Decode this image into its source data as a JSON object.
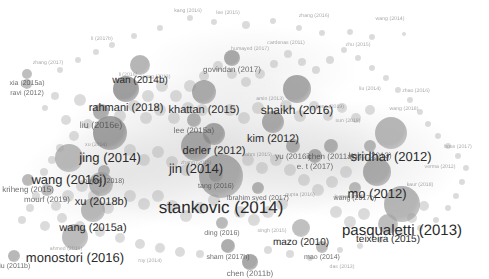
{
  "figure": {
    "kind": "bibliometric-co-citation-network",
    "tool_style": "VOSviewer density/network map",
    "background_color": "#ffffff",
    "node_color": "#8a8a8a",
    "node_color_dark": "#4d4d4d",
    "label_color": "#2b2b2b",
    "width": 489,
    "height": 279
  },
  "chart_data": {
    "type": "scatter",
    "title": "",
    "xlabel": "",
    "ylabel": "",
    "grid": false,
    "legend": "none",
    "xlim": [
      0,
      489
    ],
    "ylim": [
      0,
      279
    ],
    "note": "Node size encodes citation weight; position encodes co-citation similarity. Greyscale rendering.",
    "nodes": [
      {
        "label": "stankovic (2014)",
        "x": 221,
        "y": 176,
        "r": 22,
        "font": 17,
        "tier": "major",
        "shade": "#8f8f8f"
      },
      {
        "label": "pasqualetti (2013)",
        "x": 402,
        "y": 204,
        "r": 18,
        "font": 15,
        "tier": "major",
        "shade": "#9a9a9a"
      },
      {
        "label": "wang (2016j)",
        "x": 69,
        "y": 158,
        "r": 14,
        "font": 13,
        "tier": "major",
        "shade": "#a0a0a0"
      },
      {
        "label": "jin (2014)",
        "x": 196,
        "y": 146,
        "r": 15,
        "font": 13,
        "tier": "major",
        "shade": "#8b8b8b"
      },
      {
        "label": "monostori (2016)",
        "x": 75,
        "y": 237,
        "r": 13,
        "font": 13,
        "tier": "major",
        "shade": "#a3a3a3"
      },
      {
        "label": "sridhar (2012)",
        "x": 391,
        "y": 133,
        "r": 16,
        "font": 13,
        "tier": "major",
        "shade": "#9d9d9d"
      },
      {
        "label": "mo (2012)",
        "x": 377,
        "y": 172,
        "r": 14,
        "font": 13,
        "tier": "major",
        "shade": "#8d8d8d"
      },
      {
        "label": "jing (2014)",
        "x": 110,
        "y": 133,
        "r": 17,
        "font": 13,
        "tier": "major",
        "shade": "#7e7e7e"
      },
      {
        "label": "shaikh (2016)",
        "x": 297,
        "y": 89,
        "r": 14,
        "font": 12,
        "tier": "major",
        "shade": "#888888"
      },
      {
        "label": "wang (2015a)",
        "x": 93,
        "y": 210,
        "r": 12,
        "font": 11,
        "tier": "mid",
        "shade": "#9f9f9f"
      },
      {
        "label": "xu (2018b)",
        "x": 101,
        "y": 184,
        "r": 12,
        "font": 11,
        "tier": "mid",
        "shade": "#979797"
      },
      {
        "label": "rahmani (2018)",
        "x": 126,
        "y": 89,
        "r": 13,
        "font": 11,
        "tier": "mid",
        "shade": "#7a7a7a"
      },
      {
        "label": "khattan (2015)",
        "x": 204,
        "y": 92,
        "r": 12,
        "font": 11,
        "tier": "mid",
        "shade": "#8e8e8e"
      },
      {
        "label": "derler (2012)",
        "x": 214,
        "y": 134,
        "r": 11,
        "font": 11,
        "tier": "mid",
        "shade": "#858585"
      },
      {
        "label": "kim (2012)",
        "x": 273,
        "y": 122,
        "r": 11,
        "font": 11,
        "tier": "mid",
        "shade": "#8c8c8c"
      },
      {
        "label": "wan (2014b)",
        "x": 140,
        "y": 65,
        "r": 10,
        "font": 10,
        "tier": "mid",
        "shade": "#9a9a9a"
      },
      {
        "label": "teixeira (2015)",
        "x": 388,
        "y": 224,
        "r": 10,
        "font": 10,
        "tier": "mid",
        "shade": "#a5a5a5"
      },
      {
        "label": "mazo (2010)",
        "x": 301,
        "y": 228,
        "r": 9,
        "font": 10,
        "tier": "mid",
        "shade": "#a8a8a8"
      },
      {
        "label": "liu (2016e)",
        "x": 101,
        "y": 112,
        "r": 8,
        "font": 9,
        "tier": "small",
        "shade": "#909090"
      },
      {
        "label": "govindan (2017)",
        "x": 232,
        "y": 58,
        "r": 8,
        "font": 8,
        "tier": "small",
        "shade": "#8a8a8a"
      },
      {
        "label": "yu (2016i)",
        "x": 293,
        "y": 146,
        "r": 7,
        "font": 8,
        "tier": "small",
        "shade": "#909090"
      },
      {
        "label": "chen (2011a)",
        "x": 331,
        "y": 146,
        "r": 7,
        "font": 8,
        "tier": "small",
        "shade": "#949494"
      },
      {
        "label": "hahn (2013)",
        "x": 370,
        "y": 146,
        "r": 6,
        "font": 8,
        "tier": "small",
        "shade": "#9c9c9c"
      },
      {
        "label": "e. t (2017)",
        "x": 315,
        "y": 156,
        "r": 7,
        "font": 8,
        "tier": "small",
        "shade": "#8d8d8d"
      },
      {
        "label": "lee (2015a)",
        "x": 194,
        "y": 120,
        "r": 7,
        "font": 8,
        "tier": "small",
        "shade": "#969696"
      },
      {
        "label": "kriheng (2015)",
        "x": 28,
        "y": 180,
        "r": 6,
        "font": 8,
        "tier": "small",
        "shade": "#a0a0a0"
      },
      {
        "label": "mourf (2019)",
        "x": 47,
        "y": 190,
        "r": 6,
        "font": 8,
        "tier": "small",
        "shade": "#a2a2a2"
      },
      {
        "label": "boyes (2018)",
        "x": 104,
        "y": 171,
        "r": 6,
        "font": 7,
        "tier": "small",
        "shade": "#9a9a9a"
      },
      {
        "label": "xia (2015a)",
        "x": 27,
        "y": 74,
        "r": 5,
        "font": 7,
        "tier": "small",
        "shade": "#a6a6a6"
      },
      {
        "label": "ravi (2012)",
        "x": 27,
        "y": 84,
        "r": 5,
        "font": 7,
        "tier": "small",
        "shade": "#a6a6a6"
      },
      {
        "label": "ibrahim syed (2017)",
        "x": 258,
        "y": 188,
        "r": 6,
        "font": 7,
        "tier": "small",
        "shade": "#969696"
      },
      {
        "label": "sham (2017h)",
        "x": 228,
        "y": 246,
        "r": 7,
        "font": 7,
        "tier": "small",
        "shade": "#8e8e8e"
      },
      {
        "label": "chen (2011b)",
        "x": 250,
        "y": 262,
        "r": 8,
        "font": 8,
        "tier": "small",
        "shade": "#878787"
      },
      {
        "label": "mao (2014)",
        "x": 322,
        "y": 247,
        "r": 6,
        "font": 7,
        "tier": "small",
        "shade": "#9f9f9f"
      },
      {
        "label": "liu (2011b)",
        "x": 14,
        "y": 256,
        "r": 6,
        "font": 7,
        "tier": "small",
        "shade": "#9d9d9d"
      },
      {
        "label": "tang (2016)",
        "x": 216,
        "y": 175,
        "r": 7,
        "font": 7,
        "tier": "small",
        "shade": "#8f8f8f"
      },
      {
        "label": "wang (2017b)",
        "x": 355,
        "y": 188,
        "r": 6,
        "font": 7,
        "tier": "small",
        "shade": "#a0a0a0"
      },
      {
        "label": "ding (2016)",
        "x": 222,
        "y": 223,
        "r": 6,
        "font": 7,
        "tier": "small",
        "shade": "#a0a0a0"
      }
    ],
    "micro_nodes": [
      {
        "x": 190,
        "y": 18,
        "r": 3
      },
      {
        "x": 214,
        "y": 22,
        "r": 3
      },
      {
        "x": 246,
        "y": 25,
        "r": 4
      },
      {
        "x": 273,
        "y": 21,
        "r": 3
      },
      {
        "x": 299,
        "y": 28,
        "r": 3
      },
      {
        "x": 322,
        "y": 33,
        "r": 3
      },
      {
        "x": 350,
        "y": 32,
        "r": 3
      },
      {
        "x": 372,
        "y": 37,
        "r": 3
      },
      {
        "x": 404,
        "y": 34,
        "r": 2
      },
      {
        "x": 160,
        "y": 28,
        "r": 3
      },
      {
        "x": 134,
        "y": 36,
        "r": 3
      },
      {
        "x": 112,
        "y": 45,
        "r": 3
      },
      {
        "x": 96,
        "y": 52,
        "r": 3
      },
      {
        "x": 78,
        "y": 60,
        "r": 3
      },
      {
        "x": 60,
        "y": 70,
        "r": 3
      },
      {
        "x": 55,
        "y": 96,
        "r": 4
      },
      {
        "x": 45,
        "y": 108,
        "r": 3
      },
      {
        "x": 66,
        "y": 120,
        "r": 5
      },
      {
        "x": 80,
        "y": 100,
        "r": 6
      },
      {
        "x": 88,
        "y": 124,
        "r": 5
      },
      {
        "x": 74,
        "y": 136,
        "r": 5
      },
      {
        "x": 60,
        "y": 148,
        "r": 4
      },
      {
        "x": 52,
        "y": 160,
        "r": 4
      },
      {
        "x": 44,
        "y": 172,
        "r": 4
      },
      {
        "x": 36,
        "y": 196,
        "r": 4
      },
      {
        "x": 30,
        "y": 208,
        "r": 4
      },
      {
        "x": 22,
        "y": 220,
        "r": 4
      },
      {
        "x": 45,
        "y": 226,
        "r": 5
      },
      {
        "x": 62,
        "y": 218,
        "r": 5
      },
      {
        "x": 80,
        "y": 226,
        "r": 5
      },
      {
        "x": 100,
        "y": 232,
        "r": 5
      },
      {
        "x": 120,
        "y": 238,
        "r": 5
      },
      {
        "x": 140,
        "y": 244,
        "r": 5
      },
      {
        "x": 160,
        "y": 248,
        "r": 5
      },
      {
        "x": 180,
        "y": 252,
        "r": 5
      },
      {
        "x": 200,
        "y": 254,
        "r": 4
      },
      {
        "x": 268,
        "y": 250,
        "r": 4
      },
      {
        "x": 290,
        "y": 254,
        "r": 4
      },
      {
        "x": 310,
        "y": 258,
        "r": 3
      },
      {
        "x": 340,
        "y": 250,
        "r": 3
      },
      {
        "x": 360,
        "y": 246,
        "r": 3
      },
      {
        "x": 380,
        "y": 240,
        "r": 3
      },
      {
        "x": 400,
        "y": 234,
        "r": 3
      },
      {
        "x": 420,
        "y": 228,
        "r": 3
      },
      {
        "x": 436,
        "y": 220,
        "r": 3
      },
      {
        "x": 448,
        "y": 208,
        "r": 3
      },
      {
        "x": 456,
        "y": 196,
        "r": 3
      },
      {
        "x": 462,
        "y": 182,
        "r": 3
      },
      {
        "x": 466,
        "y": 168,
        "r": 3
      },
      {
        "x": 458,
        "y": 156,
        "r": 3
      },
      {
        "x": 448,
        "y": 146,
        "r": 3
      },
      {
        "x": 438,
        "y": 136,
        "r": 3
      },
      {
        "x": 428,
        "y": 124,
        "r": 3
      },
      {
        "x": 420,
        "y": 112,
        "r": 3
      },
      {
        "x": 410,
        "y": 100,
        "r": 3
      },
      {
        "x": 398,
        "y": 90,
        "r": 3
      },
      {
        "x": 386,
        "y": 78,
        "r": 3
      },
      {
        "x": 372,
        "y": 68,
        "r": 3
      },
      {
        "x": 358,
        "y": 58,
        "r": 3
      },
      {
        "x": 344,
        "y": 50,
        "r": 3
      },
      {
        "x": 330,
        "y": 60,
        "r": 4
      },
      {
        "x": 316,
        "y": 70,
        "r": 4
      },
      {
        "x": 302,
        "y": 62,
        "r": 4
      },
      {
        "x": 288,
        "y": 54,
        "r": 4
      },
      {
        "x": 274,
        "y": 64,
        "r": 4
      },
      {
        "x": 260,
        "y": 74,
        "r": 5
      },
      {
        "x": 246,
        "y": 82,
        "r": 5
      },
      {
        "x": 232,
        "y": 74,
        "r": 5
      },
      {
        "x": 218,
        "y": 66,
        "r": 5
      },
      {
        "x": 204,
        "y": 76,
        "r": 5
      },
      {
        "x": 190,
        "y": 86,
        "r": 6
      },
      {
        "x": 176,
        "y": 96,
        "r": 6
      },
      {
        "x": 162,
        "y": 86,
        "r": 6
      },
      {
        "x": 148,
        "y": 96,
        "r": 6
      },
      {
        "x": 134,
        "y": 106,
        "r": 6
      },
      {
        "x": 120,
        "y": 116,
        "r": 6
      },
      {
        "x": 146,
        "y": 118,
        "r": 6
      },
      {
        "x": 160,
        "y": 110,
        "r": 6
      },
      {
        "x": 174,
        "y": 118,
        "r": 6
      },
      {
        "x": 188,
        "y": 108,
        "r": 6
      },
      {
        "x": 202,
        "y": 110,
        "r": 6
      },
      {
        "x": 230,
        "y": 110,
        "r": 6
      },
      {
        "x": 244,
        "y": 118,
        "r": 6
      },
      {
        "x": 258,
        "y": 108,
        "r": 6
      },
      {
        "x": 286,
        "y": 106,
        "r": 6
      },
      {
        "x": 300,
        "y": 116,
        "r": 6
      },
      {
        "x": 314,
        "y": 106,
        "r": 5
      },
      {
        "x": 328,
        "y": 116,
        "r": 5
      },
      {
        "x": 342,
        "y": 108,
        "r": 5
      },
      {
        "x": 356,
        "y": 118,
        "r": 5
      },
      {
        "x": 370,
        "y": 110,
        "r": 5
      },
      {
        "x": 130,
        "y": 150,
        "r": 6
      },
      {
        "x": 144,
        "y": 160,
        "r": 6
      },
      {
        "x": 158,
        "y": 152,
        "r": 6
      },
      {
        "x": 172,
        "y": 162,
        "r": 6
      },
      {
        "x": 186,
        "y": 170,
        "r": 6
      },
      {
        "x": 248,
        "y": 160,
        "r": 6
      },
      {
        "x": 262,
        "y": 168,
        "r": 6
      },
      {
        "x": 276,
        "y": 160,
        "r": 6
      },
      {
        "x": 290,
        "y": 170,
        "r": 6
      },
      {
        "x": 304,
        "y": 180,
        "r": 6
      },
      {
        "x": 318,
        "y": 190,
        "r": 6
      },
      {
        "x": 332,
        "y": 182,
        "r": 6
      },
      {
        "x": 346,
        "y": 172,
        "r": 6
      },
      {
        "x": 130,
        "y": 196,
        "r": 6
      },
      {
        "x": 144,
        "y": 204,
        "r": 6
      },
      {
        "x": 158,
        "y": 196,
        "r": 6
      },
      {
        "x": 172,
        "y": 206,
        "r": 6
      },
      {
        "x": 186,
        "y": 216,
        "r": 6
      },
      {
        "x": 200,
        "y": 208,
        "r": 6
      },
      {
        "x": 214,
        "y": 200,
        "r": 6
      },
      {
        "x": 240,
        "y": 212,
        "r": 6
      },
      {
        "x": 254,
        "y": 220,
        "r": 6
      },
      {
        "x": 268,
        "y": 212,
        "r": 6
      },
      {
        "x": 282,
        "y": 204,
        "r": 6
      },
      {
        "x": 336,
        "y": 212,
        "r": 6
      },
      {
        "x": 350,
        "y": 222,
        "r": 6
      },
      {
        "x": 364,
        "y": 214,
        "r": 6
      },
      {
        "x": 412,
        "y": 218,
        "r": 5
      },
      {
        "x": 424,
        "y": 206,
        "r": 5
      },
      {
        "x": 108,
        "y": 208,
        "r": 6
      },
      {
        "x": 94,
        "y": 196,
        "r": 6
      },
      {
        "x": 82,
        "y": 186,
        "r": 6
      },
      {
        "x": 68,
        "y": 196,
        "r": 6
      },
      {
        "x": 56,
        "y": 206,
        "r": 5
      }
    ],
    "faint_labels": [
      {
        "text": "kang (2016)",
        "x": 188,
        "y": 12
      },
      {
        "text": "lee (2015)",
        "x": 228,
        "y": 14
      },
      {
        "text": "zhang (2016)",
        "x": 314,
        "y": 17
      },
      {
        "text": "wang (2014)",
        "x": 390,
        "y": 20
      },
      {
        "text": "li (2017b)",
        "x": 102,
        "y": 40
      },
      {
        "text": "zhang (2017)",
        "x": 48,
        "y": 64
      },
      {
        "text": "humayed (2017)",
        "x": 250,
        "y": 50
      },
      {
        "text": "zhu (2015)",
        "x": 358,
        "y": 46
      },
      {
        "text": "cardenas (2011)",
        "x": 286,
        "y": 44
      },
      {
        "text": "amin (2013)",
        "x": 270,
        "y": 100
      },
      {
        "text": "peng (2019)",
        "x": 330,
        "y": 108
      },
      {
        "text": "sun (2019)",
        "x": 348,
        "y": 122
      },
      {
        "text": "wang (2018)",
        "x": 404,
        "y": 110
      },
      {
        "text": "zhao (2016)",
        "x": 416,
        "y": 92
      },
      {
        "text": "liu (2014)",
        "x": 370,
        "y": 90
      },
      {
        "text": "li (2016)",
        "x": 128,
        "y": 76
      },
      {
        "text": "wang (2013)",
        "x": 156,
        "y": 78
      },
      {
        "text": "xu (2014)",
        "x": 96,
        "y": 146
      },
      {
        "text": "lehrs (2015)",
        "x": 258,
        "y": 156
      },
      {
        "text": "zhang (2015)",
        "x": 196,
        "y": 164
      },
      {
        "text": "sharma (2016)",
        "x": 370,
        "y": 160
      },
      {
        "text": "kumar (2017)",
        "x": 350,
        "y": 198
      },
      {
        "text": "gupta (2016)",
        "x": 300,
        "y": 196
      },
      {
        "text": "singh (2015)",
        "x": 272,
        "y": 232
      },
      {
        "text": "roy (2014)",
        "x": 150,
        "y": 262
      },
      {
        "text": "das (2013)",
        "x": 342,
        "y": 268
      },
      {
        "text": "ahmed (2016)",
        "x": 66,
        "y": 250
      },
      {
        "text": "kaur (2018)",
        "x": 420,
        "y": 186
      },
      {
        "text": "verma (2012)",
        "x": 440,
        "y": 168
      },
      {
        "text": "bose (2017)",
        "x": 458,
        "y": 148
      }
    ]
  }
}
